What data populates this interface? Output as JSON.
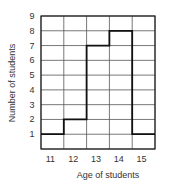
{
  "chart_data": {
    "type": "bar",
    "style": "step-histogram",
    "title": "",
    "categories": [
      "11",
      "12",
      "13",
      "14",
      "15"
    ],
    "values": [
      1,
      2,
      7,
      8,
      1
    ],
    "xlabel": "Age of students",
    "ylabel": "Number of students",
    "yticks": [
      "1",
      "2",
      "3",
      "4",
      "5",
      "6",
      "7",
      "8",
      "9"
    ],
    "ylim": [
      0,
      9
    ],
    "grid": true,
    "legend": null
  },
  "colors": {
    "grid": "#555555",
    "line": "#111111"
  }
}
